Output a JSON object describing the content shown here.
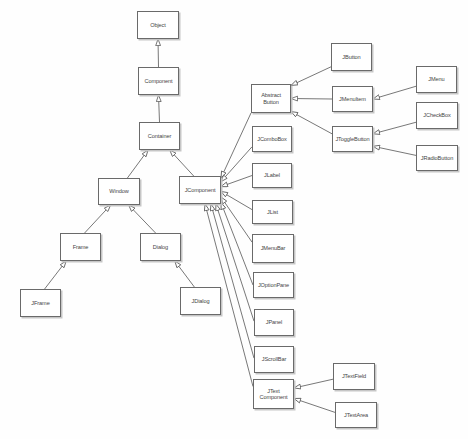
{
  "diagram": {
    "colors": {
      "background": "#fefefe",
      "box_fill": "#ffffff",
      "box_border": "#6a6a6a",
      "box_shadow": "#c6c6c6",
      "text": "#454545",
      "line": "#565656",
      "arrowhead_fill": "#ffffff"
    },
    "nodes": [
      {
        "id": "object",
        "label": "Object",
        "x": 137,
        "y": 11,
        "w": 42,
        "h": 28
      },
      {
        "id": "component",
        "label": "Component",
        "x": 138,
        "y": 67,
        "w": 41,
        "h": 28
      },
      {
        "id": "container",
        "label": "Container",
        "x": 139,
        "y": 122,
        "w": 41,
        "h": 28
      },
      {
        "id": "window",
        "label": "Window",
        "x": 98,
        "y": 178,
        "w": 42,
        "h": 27
      },
      {
        "id": "jcomponent",
        "label": "JComponent",
        "x": 179,
        "y": 176,
        "w": 42,
        "h": 28
      },
      {
        "id": "frame",
        "label": "Frame",
        "x": 60,
        "y": 233,
        "w": 41,
        "h": 28
      },
      {
        "id": "dialog",
        "label": "Dialog",
        "x": 140,
        "y": 233,
        "w": 41,
        "h": 28
      },
      {
        "id": "jframe",
        "label": "JFrame",
        "x": 20,
        "y": 289,
        "w": 41,
        "h": 28
      },
      {
        "id": "jdialog",
        "label": "JDialog",
        "x": 180,
        "y": 287,
        "w": 41,
        "h": 28
      },
      {
        "id": "abstractbutton",
        "label": "Abstract Button",
        "x": 251,
        "y": 84,
        "w": 40,
        "h": 29
      },
      {
        "id": "jcombobox",
        "label": "JComboBox",
        "x": 252,
        "y": 126,
        "w": 40,
        "h": 26
      },
      {
        "id": "jlabel",
        "label": "JLabel",
        "x": 252,
        "y": 163,
        "w": 40,
        "h": 25
      },
      {
        "id": "jlist",
        "label": "JList",
        "x": 252,
        "y": 200,
        "w": 41,
        "h": 24
      },
      {
        "id": "jmenubar",
        "label": "JMenuBar",
        "x": 252,
        "y": 234,
        "w": 42,
        "h": 29
      },
      {
        "id": "joptionpane",
        "label": "JOptionPane",
        "x": 253,
        "y": 272,
        "w": 41,
        "h": 26
      },
      {
        "id": "jpanel",
        "label": "JPanel",
        "x": 254,
        "y": 309,
        "w": 40,
        "h": 27
      },
      {
        "id": "jscrollbar",
        "label": "JScrollBar",
        "x": 254,
        "y": 346,
        "w": 40,
        "h": 27
      },
      {
        "id": "jtextcomponent",
        "label": "JText Component",
        "x": 253,
        "y": 379,
        "w": 41,
        "h": 30
      },
      {
        "id": "jbutton",
        "label": "JButton",
        "x": 331,
        "y": 43,
        "w": 41,
        "h": 28
      },
      {
        "id": "jmenuitem",
        "label": "JMenuItem",
        "x": 332,
        "y": 86,
        "w": 41,
        "h": 26
      },
      {
        "id": "jtogglebutton",
        "label": "JToggleButton",
        "x": 332,
        "y": 126,
        "w": 41,
        "h": 26
      },
      {
        "id": "jmenu",
        "label": "JMenu",
        "x": 416,
        "y": 66,
        "w": 41,
        "h": 27
      },
      {
        "id": "jcheckbox",
        "label": "JCheckBox",
        "x": 416,
        "y": 102,
        "w": 42,
        "h": 27
      },
      {
        "id": "jradiobutton",
        "label": "JRadioButton",
        "x": 416,
        "y": 145,
        "w": 42,
        "h": 26
      },
      {
        "id": "jtextfield",
        "label": "JTextField",
        "x": 333,
        "y": 363,
        "w": 42,
        "h": 27
      },
      {
        "id": "jtextarea",
        "label": "JTextArea",
        "x": 335,
        "y": 402,
        "w": 42,
        "h": 26
      }
    ],
    "edges": [
      {
        "from": "component",
        "to": "object",
        "fromAnchor": [
          0.5,
          0
        ],
        "toAnchor": [
          0.5,
          1
        ]
      },
      {
        "from": "container",
        "to": "component",
        "fromAnchor": [
          0.5,
          0
        ],
        "toAnchor": [
          0.5,
          1
        ]
      },
      {
        "from": "window",
        "to": "container",
        "fromAnchor": [
          0.7,
          0
        ],
        "toAnchor": [
          0.22,
          1
        ]
      },
      {
        "from": "jcomponent",
        "to": "container",
        "fromAnchor": [
          0.35,
          0
        ],
        "toAnchor": [
          0.75,
          1
        ]
      },
      {
        "from": "frame",
        "to": "window",
        "fromAnchor": [
          0.6,
          0
        ],
        "toAnchor": [
          0.3,
          1
        ]
      },
      {
        "from": "dialog",
        "to": "window",
        "fromAnchor": [
          0.38,
          0
        ],
        "toAnchor": [
          0.73,
          1
        ]
      },
      {
        "from": "jframe",
        "to": "frame",
        "fromAnchor": [
          0.6,
          0
        ],
        "toAnchor": [
          0.15,
          1
        ]
      },
      {
        "from": "jdialog",
        "to": "dialog",
        "fromAnchor": [
          0.35,
          0
        ],
        "toAnchor": [
          0.85,
          1
        ]
      },
      {
        "from": "jbutton",
        "to": "abstractbutton",
        "fromAnchor": [
          0,
          0.85
        ],
        "toAnchor": [
          1,
          0.05
        ]
      },
      {
        "from": "jmenuitem",
        "to": "abstractbutton",
        "fromAnchor": [
          0,
          0.5
        ],
        "toAnchor": [
          1,
          0.5
        ]
      },
      {
        "from": "jtogglebutton",
        "to": "abstractbutton",
        "fromAnchor": [
          0,
          0.3
        ],
        "toAnchor": [
          1,
          0.95
        ]
      },
      {
        "from": "jmenu",
        "to": "jmenuitem",
        "fromAnchor": [
          0,
          0.75
        ],
        "toAnchor": [
          1,
          0.5
        ]
      },
      {
        "from": "jcheckbox",
        "to": "jtogglebutton",
        "fromAnchor": [
          0,
          0.75
        ],
        "toAnchor": [
          1,
          0.3
        ]
      },
      {
        "from": "jradiobutton",
        "to": "jtogglebutton",
        "fromAnchor": [
          0,
          0.4
        ],
        "toAnchor": [
          1,
          0.78
        ]
      },
      {
        "from": "abstractbutton",
        "to": "jcomponent",
        "fromAnchor": [
          0,
          1
        ],
        "toAnchor": [
          1,
          0.07
        ]
      },
      {
        "from": "jcombobox",
        "to": "jcomponent",
        "fromAnchor": [
          0,
          0.8
        ],
        "toAnchor": [
          1,
          0.2
        ]
      },
      {
        "from": "jlabel",
        "to": "jcomponent",
        "fromAnchor": [
          0,
          0.5
        ],
        "toAnchor": [
          1,
          0.38
        ]
      },
      {
        "from": "jlist",
        "to": "jcomponent",
        "fromAnchor": [
          0,
          0.4
        ],
        "toAnchor": [
          1,
          0.55
        ]
      },
      {
        "from": "jmenubar",
        "to": "jcomponent",
        "fromAnchor": [
          0,
          0.28
        ],
        "toAnchor": [
          1,
          0.75
        ]
      },
      {
        "from": "joptionpane",
        "to": "jcomponent",
        "fromAnchor": [
          0,
          0.5
        ],
        "toAnchor": [
          1,
          0.95
        ]
      },
      {
        "from": "jpanel",
        "to": "jcomponent",
        "fromAnchor": [
          0,
          0.45
        ],
        "toAnchor": [
          0.88,
          1
        ]
      },
      {
        "from": "jscrollbar",
        "to": "jcomponent",
        "fromAnchor": [
          0,
          0.45
        ],
        "toAnchor": [
          0.76,
          1
        ]
      },
      {
        "from": "jtextcomponent",
        "to": "jcomponent",
        "fromAnchor": [
          0,
          0.25
        ],
        "toAnchor": [
          0.62,
          1
        ]
      },
      {
        "from": "jtextfield",
        "to": "jtextcomponent",
        "fromAnchor": [
          0,
          0.6
        ],
        "toAnchor": [
          1,
          0.3
        ]
      },
      {
        "from": "jtextarea",
        "to": "jtextcomponent",
        "fromAnchor": [
          0,
          0.4
        ],
        "toAnchor": [
          1,
          0.65
        ]
      }
    ]
  }
}
